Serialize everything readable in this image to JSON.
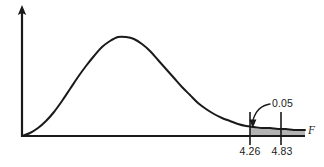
{
  "figure": {
    "title": "",
    "background_color": "#ffffff",
    "line_color": "#1a1a1a",
    "shade_color": "#b3b3b3",
    "shade_edge_color": "#1a1a1a"
  },
  "axes": {
    "x_axis_label": "F",
    "y_axis_label": "",
    "x_axis_arrow": false,
    "y_axis_arrow": true
  },
  "ticks": [
    {
      "name": "critical-value-lower",
      "label": "4.26",
      "x_px": 250
    },
    {
      "name": "critical-value-upper",
      "label": "4.83",
      "x_px": 281
    }
  ],
  "annotations": [
    {
      "name": "tail-area-annotation",
      "label": "0.05",
      "label_x_px": 272,
      "label_y_px": 107,
      "pointer_x_px": 252,
      "pointer_y_px": 126
    }
  ],
  "chart_data": {
    "type": "line",
    "title": "",
    "xlabel": "F",
    "ylabel": "",
    "grid": false,
    "legend": null,
    "distribution": "F-distribution density",
    "curve_points_px": [
      [
        22,
        136
      ],
      [
        30,
        133
      ],
      [
        38,
        128
      ],
      [
        46,
        121
      ],
      [
        54,
        112
      ],
      [
        62,
        101
      ],
      [
        70,
        89
      ],
      [
        78,
        77
      ],
      [
        86,
        66
      ],
      [
        94,
        56
      ],
      [
        102,
        47
      ],
      [
        110,
        41
      ],
      [
        118,
        37
      ],
      [
        126,
        37
      ],
      [
        134,
        39
      ],
      [
        142,
        44
      ],
      [
        150,
        51
      ],
      [
        158,
        60
      ],
      [
        166,
        69
      ],
      [
        174,
        78
      ],
      [
        182,
        87
      ],
      [
        190,
        95
      ],
      [
        198,
        103
      ],
      [
        206,
        109
      ],
      [
        214,
        114
      ],
      [
        222,
        118
      ],
      [
        230,
        121
      ],
      [
        238,
        124
      ],
      [
        246,
        126
      ],
      [
        254,
        127
      ],
      [
        262,
        128
      ],
      [
        270,
        128
      ],
      [
        278,
        129
      ],
      [
        286,
        129
      ],
      [
        294,
        130
      ],
      [
        305,
        130
      ]
    ],
    "shaded_region": {
      "name": "rejection-region",
      "from_x_px": 250,
      "to_x_px": 305,
      "area": 0.05,
      "label": "0.05"
    },
    "axis_origin_px": [
      22,
      136
    ],
    "x_axis_end_px": [
      305,
      136
    ],
    "y_axis_top_px": [
      22,
      8
    ],
    "annotated_values": [
      "4.26",
      "4.83",
      "0.05"
    ]
  }
}
